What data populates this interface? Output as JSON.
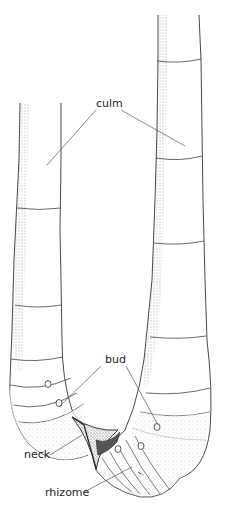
{
  "diagram": {
    "labels": {
      "culm": "culm",
      "bud": "bud",
      "neck": "neck",
      "rhizome": "rhizome"
    },
    "colors": {
      "line": "#333333",
      "leader": "#555555",
      "stipple": "#888888",
      "neck_dark": "#222222"
    }
  }
}
